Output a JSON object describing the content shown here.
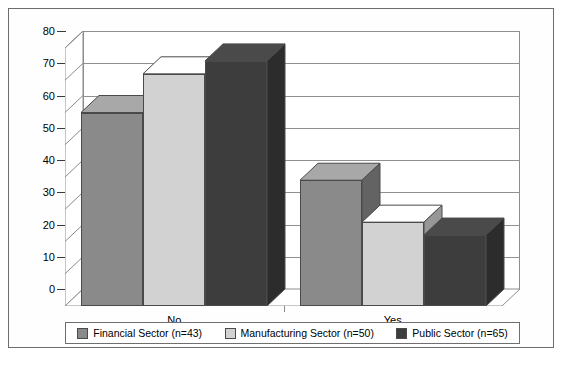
{
  "chart": {
    "type": "bar",
    "title": "",
    "xlabel": "",
    "ylabel": ""
  },
  "axis": {
    "y_ticks": [
      "0",
      "10",
      "20",
      "30",
      "40",
      "50",
      "60",
      "70",
      "80"
    ],
    "y_min": 0,
    "y_max": 80,
    "x_categories": [
      "No",
      "Yes"
    ]
  },
  "legend": {
    "items": [
      {
        "label": "Financial Sector (n=43)",
        "color": "#8a8a8a"
      },
      {
        "label": "Manufacturing Sector (n=50)",
        "color": "#d2d2d2"
      },
      {
        "label": "Public Sector (n=65)",
        "color": "#3d3d3d"
      }
    ]
  },
  "chart_data": {
    "type": "bar",
    "title": "",
    "xlabel": "",
    "ylabel": "",
    "ylim": [
      0,
      80
    ],
    "ytick_step": 10,
    "grid": true,
    "legend_position": "bottom",
    "three_d": true,
    "categories": [
      "No",
      "Yes"
    ],
    "series": [
      {
        "name": "Financial Sector (n=43)",
        "color": "#8a8a8a",
        "values": [
          60,
          39
        ]
      },
      {
        "name": "Manufacturing Sector (n=50)",
        "color": "#d2d2d2",
        "values": [
          72,
          26
        ]
      },
      {
        "name": "Public Sector (n=65)",
        "color": "#3d3d3d",
        "values": [
          76,
          22
        ]
      }
    ]
  }
}
